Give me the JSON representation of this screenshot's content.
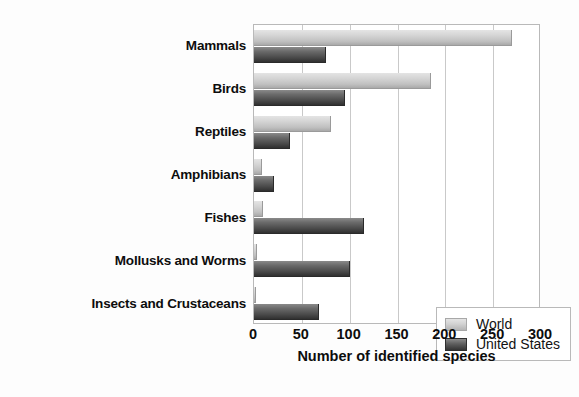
{
  "chart_data": {
    "type": "bar",
    "orientation": "horizontal",
    "title": "",
    "xlabel": "Number of identified species",
    "ylabel": "",
    "xlim": [
      0,
      300
    ],
    "xticks": [
      0,
      50,
      100,
      150,
      200,
      250,
      300
    ],
    "grid": true,
    "legend_position": "inside-bottom-right",
    "categories": [
      "Mammals",
      "Birds",
      "Reptiles",
      "Amphibians",
      "Fishes",
      "Mollusks and Worms",
      "Insects and Crustaceans"
    ],
    "series": [
      {
        "name": "World",
        "color": "#d2d2d2",
        "values": [
          270,
          185,
          80,
          8,
          9,
          3,
          2
        ]
      },
      {
        "name": "United States",
        "color": "#4a4a4a",
        "values": [
          75,
          95,
          38,
          21,
          115,
          100,
          68
        ]
      }
    ]
  },
  "legend": {
    "entries": [
      {
        "label": "World",
        "swatch": "world-swatch"
      },
      {
        "label": "United States",
        "swatch": "united-states-swatch"
      }
    ]
  },
  "axis": {
    "x_title": "Number of identified species",
    "x_tick_labels": [
      "0",
      "50",
      "100",
      "150",
      "200",
      "250",
      "300"
    ]
  }
}
